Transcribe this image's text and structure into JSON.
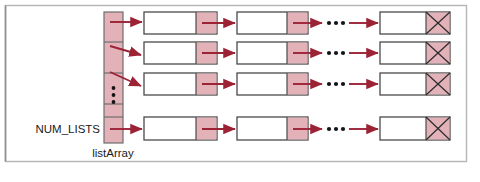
{
  "figure": {
    "type": "diagram",
    "subtype": "array-of-linked-lists",
    "labels": {
      "num_lists": "NUM_LISTS",
      "list_array": "listArray"
    },
    "colors": {
      "pointer_fill": "#e3b2b9",
      "arrow": "#9c2236",
      "node_stroke": "#4a4a4a",
      "frame": "#b5b5b5",
      "background": "#ffffff",
      "ellipsis_dot": "#1a1a1a"
    },
    "frame": {
      "x": 5,
      "y": 5,
      "width": 462,
      "height": 157
    },
    "array": {
      "x": 104,
      "y": 12,
      "width": 19,
      "height": 131,
      "cell_count": 5,
      "cells": [
        {
          "index": 0,
          "y": 12,
          "height": 30,
          "kind": "pointer",
          "arrow": "horizontal"
        },
        {
          "index": 1,
          "y": 42,
          "height": 31,
          "kind": "pointer",
          "arrow": "diagonal"
        },
        {
          "index": 2,
          "y": 73,
          "height": 31,
          "kind": "pointer",
          "arrow": "diagonal"
        },
        {
          "index": 3,
          "y": 104,
          "height": 13,
          "kind": "ellipsis",
          "arrow": "none"
        },
        {
          "index": 4,
          "y": 117,
          "height": 26,
          "kind": "pointer",
          "arrow": "horizontal"
        }
      ]
    },
    "rows": [
      {
        "index": 0,
        "y": 12,
        "height": 22
      },
      {
        "index": 1,
        "y": 42,
        "height": 22
      },
      {
        "index": 2,
        "y": 73,
        "height": 22
      },
      {
        "index": 3,
        "y": 117,
        "height": 23
      }
    ],
    "node_columns": [
      {
        "index": 0,
        "x": 144,
        "width": 73,
        "data_width": 52,
        "pointer_width": 21,
        "terminator": false
      },
      {
        "index": 1,
        "x": 237,
        "width": 71,
        "data_width": 50,
        "pointer_width": 21,
        "terminator": false
      },
      {
        "index": 2,
        "x": 380,
        "width": 70,
        "data_width": 46,
        "pointer_width": 24,
        "terminator": true
      }
    ],
    "ellipsis_horizontal": {
      "x": 327,
      "dot_count": 3
    },
    "ellipsis_vertical": {
      "dot_count": 3
    }
  }
}
